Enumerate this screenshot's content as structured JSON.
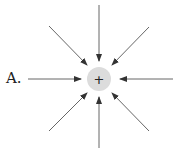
{
  "diagram": {
    "option_label": "A.",
    "charge_symbol": "+",
    "charge_fill": "#dcdcdc",
    "line_color": "#444444"
  }
}
